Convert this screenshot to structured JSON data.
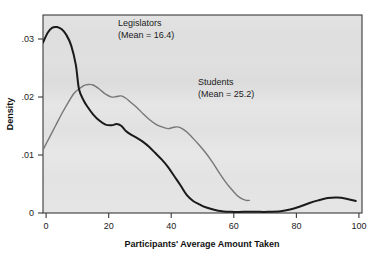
{
  "figure": {
    "background_color": "#ffffff",
    "plot_background_color": "#e2e2e2",
    "frame_color": "#3a3a3a"
  },
  "chart_data": {
    "type": "line",
    "title": "",
    "subtitle": "",
    "xlabel": "Participants' Average Amount Taken",
    "ylabel": "Density",
    "xlim": [
      0,
      102
    ],
    "ylim": [
      0,
      0.0345
    ],
    "xticks": [
      0,
      20,
      40,
      60,
      80,
      100
    ],
    "xtick_labels": [
      "0",
      "20",
      "40",
      "60",
      "80",
      "100"
    ],
    "yticks": [
      0,
      0.01,
      0.02,
      0.03
    ],
    "ytick_labels": [
      "0",
      ".01",
      ".02",
      ".03"
    ],
    "grid": false,
    "legend_position": "inline-annotations",
    "series": [
      {
        "name": "Legislators",
        "mean": 16.4,
        "color": "#1a1a1a",
        "line_width": 2.0,
        "annotation": [
          "Legislators",
          "(Mean = 16.4)"
        ],
        "x": [
          0,
          1.5,
          3,
          4.5,
          6,
          7.5,
          9,
          10.5,
          11.5,
          13,
          14.5,
          16,
          18,
          20,
          22,
          23.5,
          25,
          26.5,
          28,
          30,
          32,
          34,
          36,
          38,
          40,
          42,
          44,
          46,
          48,
          50,
          52,
          56,
          60,
          64,
          68,
          72,
          76,
          79,
          82,
          85,
          88,
          91,
          94,
          97,
          100
        ],
        "y": [
          0.0297,
          0.0314,
          0.0323,
          0.0324,
          0.032,
          0.031,
          0.0292,
          0.0258,
          0.0216,
          0.0196,
          0.0183,
          0.0172,
          0.0161,
          0.0154,
          0.0153,
          0.0155,
          0.0152,
          0.0143,
          0.0137,
          0.0131,
          0.0124,
          0.0115,
          0.0104,
          0.0093,
          0.008,
          0.0064,
          0.0048,
          0.0031,
          0.0021,
          0.0015,
          0.001,
          0.0004,
          0.0002,
          0.0002,
          0.0002,
          0.0002,
          0.0003,
          0.0006,
          0.0011,
          0.0017,
          0.0022,
          0.0026,
          0.0027,
          0.0025,
          0.0021
        ]
      },
      {
        "name": "Students",
        "mean": 25.2,
        "color": "#777777",
        "line_width": 1.4,
        "annotation": [
          "Students",
          "(Mean = 25.2)"
        ],
        "x": [
          0,
          2,
          4,
          6,
          8,
          10,
          11.5,
          13,
          14.5,
          16,
          18,
          20,
          22,
          23.5,
          25,
          26.5,
          28,
          30,
          32,
          34,
          36,
          38,
          40,
          41.5,
          43,
          44.5,
          46,
          48,
          50,
          52,
          54,
          56,
          58,
          60,
          62,
          63.5,
          65,
          66
        ],
        "y": [
          0.011,
          0.0131,
          0.0152,
          0.0173,
          0.0192,
          0.0209,
          0.0216,
          0.0222,
          0.0224,
          0.0223,
          0.0216,
          0.0207,
          0.0202,
          0.0203,
          0.0204,
          0.02,
          0.0193,
          0.0184,
          0.0173,
          0.0163,
          0.0155,
          0.015,
          0.0147,
          0.0149,
          0.015,
          0.0147,
          0.0141,
          0.013,
          0.0118,
          0.0105,
          0.009,
          0.0073,
          0.0057,
          0.0043,
          0.0031,
          0.0025,
          0.0022,
          0.0022
        ]
      }
    ],
    "annotations": [
      {
        "name": "legislators-label",
        "line1": "Legislators",
        "line2": "(Mean = 16.4)",
        "x_px": 118,
        "y_px": 26
      },
      {
        "name": "students-label",
        "line1": "Students",
        "line2": "(Mean = 25.2)",
        "x_px": 198,
        "y_px": 85
      }
    ]
  }
}
